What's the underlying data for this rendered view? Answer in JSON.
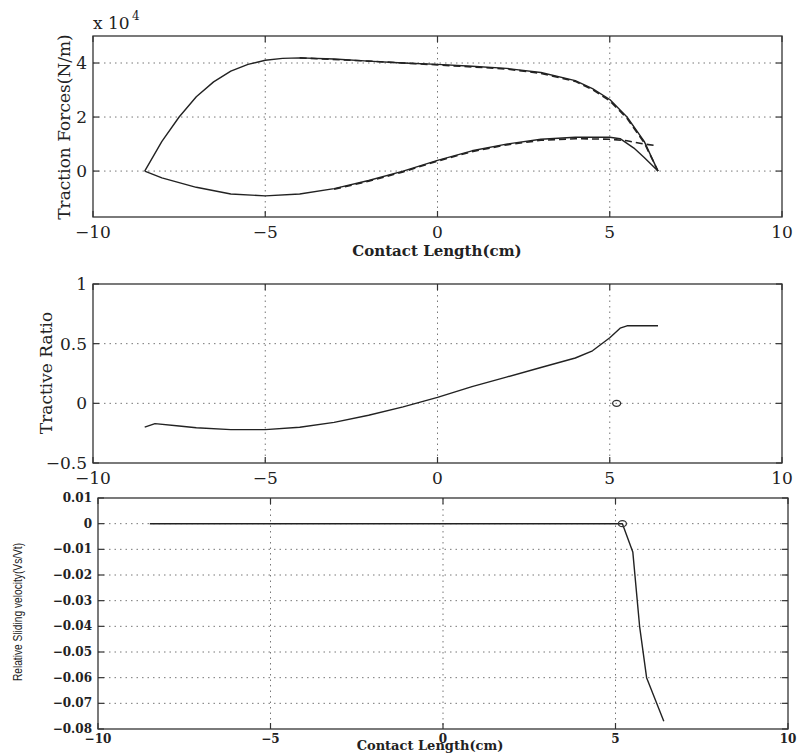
{
  "chart_data": [
    {
      "type": "line",
      "id": "traction",
      "title": "",
      "xlabel": "Contact Length(cm)",
      "ylabel": "Traction Forces(N/m)",
      "y_multiplier_label": "x 10",
      "y_multiplier_exp": "4",
      "xlim": [
        -10,
        10
      ],
      "ylim": [
        -1.7,
        5
      ],
      "xticks": [
        -10,
        -5,
        0,
        5,
        10
      ],
      "xtick_labels": [
        "−10",
        "−5",
        "0",
        "5",
        "10"
      ],
      "yticks": [
        0,
        2,
        4
      ],
      "ytick_labels": [
        "0",
        "2",
        "4"
      ],
      "grid": true,
      "series": [
        {
          "name": "upper-solid",
          "style": "solid",
          "x": [
            -8.5,
            -8.0,
            -7.5,
            -7.0,
            -6.5,
            -6.0,
            -5.5,
            -5.0,
            -4.5,
            -4.0,
            -3.0,
            -2.0,
            -1.0,
            0.0,
            1.0,
            2.0,
            3.0,
            4.0,
            4.5,
            5.0,
            5.5,
            6.0,
            6.4
          ],
          "y": [
            0.0,
            1.1,
            2.0,
            2.75,
            3.3,
            3.7,
            3.95,
            4.1,
            4.17,
            4.19,
            4.15,
            4.07,
            4.0,
            3.95,
            3.88,
            3.8,
            3.65,
            3.35,
            3.05,
            2.65,
            2.0,
            1.1,
            0.0
          ]
        },
        {
          "name": "upper-dashed",
          "style": "dashed",
          "x": [
            -4.0,
            -2.0,
            0.0,
            2.0,
            3.0,
            4.0,
            4.5,
            5.0,
            5.5,
            6.0,
            6.4
          ],
          "y": [
            4.19,
            4.07,
            3.93,
            3.78,
            3.62,
            3.32,
            3.02,
            2.6,
            1.95,
            1.05,
            0.0
          ]
        },
        {
          "name": "lower-solid",
          "style": "solid",
          "x": [
            -8.5,
            -8.0,
            -7.0,
            -6.0,
            -5.0,
            -4.0,
            -3.0,
            -2.0,
            -1.0,
            0.0,
            1.0,
            2.0,
            3.0,
            4.0,
            5.0,
            5.3,
            5.7,
            6.0,
            6.4
          ],
          "y": [
            0.0,
            -0.25,
            -0.6,
            -0.85,
            -0.92,
            -0.85,
            -0.65,
            -0.35,
            0.0,
            0.4,
            0.75,
            1.0,
            1.18,
            1.25,
            1.25,
            1.2,
            0.85,
            0.5,
            0.0
          ]
        },
        {
          "name": "lower-dashed",
          "style": "dashed",
          "x": [
            -3.0,
            -2.0,
            -1.0,
            0.0,
            1.0,
            2.0,
            3.0,
            4.0,
            5.0,
            5.5,
            6.0,
            6.3
          ],
          "y": [
            -0.67,
            -0.38,
            -0.03,
            0.37,
            0.72,
            0.97,
            1.14,
            1.2,
            1.18,
            1.12,
            1.0,
            0.95
          ]
        }
      ],
      "frame": {
        "x0": 93,
        "x1": 782,
        "y0": 36,
        "y1": 217
      }
    },
    {
      "type": "line",
      "id": "tractive-ratio",
      "title": "",
      "xlabel": "",
      "ylabel": "Tractive Ratio",
      "xlim": [
        -10,
        10
      ],
      "ylim": [
        -0.5,
        1
      ],
      "xticks": [
        -10,
        -5,
        0,
        5,
        10
      ],
      "xtick_labels": [
        "−10",
        "−5",
        "0",
        "5",
        "10"
      ],
      "yticks": [
        -0.5,
        0,
        0.5,
        1
      ],
      "ytick_labels": [
        "−0.5",
        "0",
        "0.5",
        "1"
      ],
      "grid": true,
      "series": [
        {
          "name": "ratio",
          "style": "solid",
          "x": [
            -8.5,
            -8.2,
            -7.5,
            -7.0,
            -6.0,
            -5.0,
            -4.0,
            -3.0,
            -2.0,
            -1.0,
            0.0,
            1.0,
            2.0,
            3.0,
            4.0,
            4.5,
            5.0,
            5.3,
            5.5,
            6.0,
            6.4
          ],
          "y": [
            -0.2,
            -0.17,
            -0.19,
            -0.205,
            -0.22,
            -0.22,
            -0.2,
            -0.16,
            -0.1,
            -0.03,
            0.05,
            0.14,
            0.22,
            0.3,
            0.38,
            0.44,
            0.55,
            0.63,
            0.65,
            0.65,
            0.65
          ]
        }
      ],
      "markers": [
        {
          "shape": "circle",
          "x": 5.2,
          "y": 0
        }
      ],
      "frame": {
        "x0": 93,
        "x1": 782,
        "y0": 284,
        "y1": 463
      }
    },
    {
      "type": "line",
      "id": "sliding-velocity",
      "title": "",
      "xlabel": "Contact Length(cm)",
      "ylabel": "Relative Sliding velocity(Vs/Vt)",
      "xlim": [
        -10,
        10
      ],
      "ylim": [
        -0.08,
        0.01
      ],
      "xticks": [
        -10,
        -5,
        0,
        5,
        10
      ],
      "xtick_labels": [
        "−10",
        "−5",
        "0",
        "5",
        "10"
      ],
      "yticks": [
        0.01,
        0,
        -0.01,
        -0.02,
        -0.03,
        -0.04,
        -0.05,
        -0.06,
        -0.07,
        -0.08
      ],
      "ytick_labels": [
        "0.01",
        "0",
        "−0.01",
        "−0.02",
        "−0.03",
        "−0.04",
        "−0.05",
        "−0.06",
        "−0.07",
        "−0.08"
      ],
      "grid": true,
      "series": [
        {
          "name": "velocity",
          "style": "solid",
          "x": [
            -8.5,
            0.0,
            5.0,
            5.2,
            5.5,
            5.7,
            5.9,
            6.4
          ],
          "y": [
            0,
            0,
            0,
            0,
            -0.011,
            -0.04,
            -0.06,
            -0.077
          ]
        }
      ],
      "markers": [
        {
          "shape": "circle",
          "x": 5.2,
          "y": 0
        }
      ],
      "frame": {
        "x0": 98,
        "x1": 788,
        "y0": 498,
        "y1": 729
      }
    }
  ]
}
